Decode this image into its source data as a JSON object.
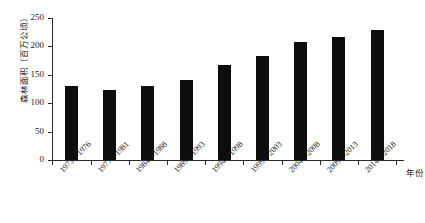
{
  "chart_data": {
    "type": "bar",
    "title": "",
    "xlabel": "年份",
    "ylabel": "森林面积（百万公顷）",
    "categories": [
      "1973—1976",
      "1977—1981",
      "1984—1988",
      "1989—1993",
      "1994—1998",
      "1999—2003",
      "2004—2008",
      "2009—2013",
      "2014—2018"
    ],
    "values": [
      130,
      124,
      131,
      141,
      167,
      183,
      207,
      216,
      229
    ],
    "ylim": [
      0,
      250
    ],
    "yticks": [
      0,
      50,
      100,
      150,
      200,
      250
    ],
    "ytick_labels": [
      "0",
      "50",
      "100",
      "150",
      "200",
      "250"
    ],
    "grid": false,
    "legend": "none",
    "bar_color": "#0d0d0d",
    "axis_color": "#2b2b2b"
  }
}
